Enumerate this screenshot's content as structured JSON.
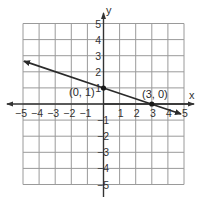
{
  "chart_data": {
    "type": "line",
    "title": "",
    "xlabel": "x",
    "ylabel": "y",
    "xlim": [
      -5,
      5
    ],
    "ylim": [
      -5,
      5
    ],
    "grid": true,
    "x_ticks": [
      -5,
      -4,
      -3,
      -2,
      -1,
      1,
      2,
      3,
      4,
      5
    ],
    "y_ticks": [
      5,
      4,
      3,
      2,
      1,
      -1,
      -2,
      -3,
      -4,
      -5
    ],
    "series": [
      {
        "name": "line",
        "equation": "y = -x/3 + 1",
        "slope": -0.3333,
        "intercept": 1,
        "x": [
          -5,
          4.75
        ],
        "y": [
          2.667,
          -0.583
        ],
        "arrows": "both"
      }
    ],
    "points": [
      {
        "x": 0,
        "y": 1,
        "label": "(0, 1)"
      },
      {
        "x": 3,
        "y": 0,
        "label": "(3, 0)"
      }
    ]
  },
  "labels": {
    "x_axis": "x",
    "y_axis": "y",
    "point_a": "(0, 1)",
    "point_b": "(3, 0)",
    "x_ticks": [
      "−5",
      "−4",
      "−3",
      "−2",
      "−1",
      "1",
      "2",
      "3",
      "4",
      "5"
    ],
    "y_ticks_pos": [
      "5",
      "4",
      "3",
      "2",
      "1"
    ],
    "y_ticks_neg": [
      "−1",
      "−2",
      "−3",
      "−4",
      "−5"
    ]
  },
  "colors": {
    "grid": "#9a9a9a",
    "axis": "#333333",
    "line": "#2a2a2a",
    "background": "#ffffff"
  }
}
